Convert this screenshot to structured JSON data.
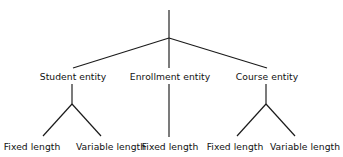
{
  "diagram": {
    "type": "hierarchy-tree",
    "background_color": "#ffffff",
    "line_color": "#1a1a1a",
    "text_color": "#111111",
    "root": {
      "label": "",
      "x": 169,
      "stem_top_y": 10,
      "stem_bottom_y": 68
    },
    "levels": [
      {
        "name": "entity-level",
        "label_y": 80,
        "nodes": [
          {
            "id": "student",
            "label": "Student entity",
            "x": 73
          },
          {
            "id": "enrollment",
            "label": "Enrollment entity",
            "x": 170
          },
          {
            "id": "course",
            "label": "Course entity",
            "x": 267
          }
        ]
      },
      {
        "name": "length-level",
        "label_y": 150,
        "nodes": [
          {
            "id": "student-fixed",
            "label": "Fixed length",
            "x": 32,
            "parent": "student"
          },
          {
            "id": "student-variable",
            "label": "Variable length",
            "x": 111,
            "parent": "student"
          },
          {
            "id": "enrollment-fixed",
            "label": "Fixed length",
            "x": 170,
            "parent": "enrollment"
          },
          {
            "id": "course-fixed",
            "label": "Fixed length",
            "x": 235,
            "parent": "course"
          },
          {
            "id": "course-variable",
            "label": "Variable length",
            "x": 305,
            "parent": "course"
          }
        ]
      }
    ],
    "edges": [
      {
        "id": "root-stem",
        "from": "root-top",
        "to": "root-junction",
        "x1": 169,
        "y1": 10,
        "x2": 169,
        "y2": 38
      },
      {
        "id": "root-to-student",
        "from": "root",
        "to": "student",
        "x1": 169,
        "y1": 38,
        "x2": 73,
        "y2": 68
      },
      {
        "id": "root-to-enrollment",
        "from": "root",
        "to": "enrollment",
        "x1": 169,
        "y1": 38,
        "x2": 169,
        "y2": 68
      },
      {
        "id": "root-to-course",
        "from": "root",
        "to": "course",
        "x1": 169,
        "y1": 38,
        "x2": 267,
        "y2": 68
      },
      {
        "id": "student-stem",
        "from": "student",
        "to": "student-junction",
        "x1": 72,
        "y1": 84,
        "x2": 72,
        "y2": 104
      },
      {
        "id": "student-to-fixed",
        "from": "student-junction",
        "to": "student-fixed",
        "x1": 72,
        "y1": 104,
        "x2": 43,
        "y2": 136
      },
      {
        "id": "student-to-variable",
        "from": "student-junction",
        "to": "student-variable",
        "x1": 72,
        "y1": 104,
        "x2": 101,
        "y2": 136
      },
      {
        "id": "enrollment-stem",
        "from": "enrollment",
        "to": "enrollment-fixed",
        "x1": 169,
        "y1": 84,
        "x2": 169,
        "y2": 137
      },
      {
        "id": "course-stem",
        "from": "course",
        "to": "course-junction",
        "x1": 266,
        "y1": 84,
        "x2": 266,
        "y2": 104
      },
      {
        "id": "course-to-fixed",
        "from": "course-junction",
        "to": "course-fixed",
        "x1": 266,
        "y1": 104,
        "x2": 237,
        "y2": 136
      },
      {
        "id": "course-to-variable",
        "from": "course-junction",
        "to": "course-variable",
        "x1": 266,
        "y1": 104,
        "x2": 295,
        "y2": 136
      }
    ]
  }
}
